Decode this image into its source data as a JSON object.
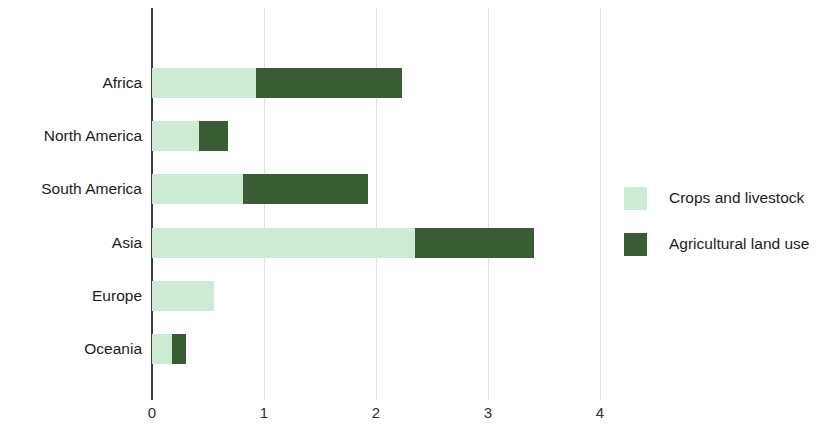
{
  "chart_data": {
    "type": "bar",
    "orientation": "horizontal",
    "stacked": true,
    "title": "",
    "subtitle": "",
    "xlabel": "",
    "ylabel": "",
    "xlim": [
      0,
      4
    ],
    "xticks": [
      0,
      1,
      2,
      3,
      4
    ],
    "xtick_labels": [
      "0",
      "1",
      "2",
      "3",
      "4"
    ],
    "grid": true,
    "grid_axis": "x",
    "legend_position": "right",
    "categories": [
      "Africa",
      "North America",
      "South America",
      "Asia",
      "Europe",
      "Oceania"
    ],
    "series": [
      {
        "name": "Crops and livestock",
        "color": "#cdebd2",
        "values": [
          0.93,
          0.42,
          0.81,
          2.35,
          0.55,
          0.18
        ]
      },
      {
        "name": "Agricultural land use",
        "color": "#3a5c34",
        "values": [
          1.3,
          0.26,
          1.12,
          1.06,
          0.0,
          0.12
        ]
      }
    ],
    "totals": [
      2.23,
      0.68,
      1.93,
      3.41,
      0.55,
      0.3
    ]
  },
  "axis": {
    "tick_labels": [
      "0",
      "1",
      "2",
      "3",
      "4"
    ]
  },
  "category_labels": [
    "Africa",
    "North America",
    "South America",
    "Asia",
    "Europe",
    "Oceania"
  ],
  "legend": {
    "entries": [
      {
        "label": "Crops and livestock",
        "color": "#cdebd2"
      },
      {
        "label": "Agricultural land use",
        "color": "#3a5c34"
      }
    ]
  },
  "colors": {
    "light_green": "#cdebd2",
    "dark_green": "#3a5c34",
    "axis": "#3d3d3d",
    "grid": "#e2e2e2",
    "text": "#1c1c1c",
    "background": "#ffffff"
  }
}
